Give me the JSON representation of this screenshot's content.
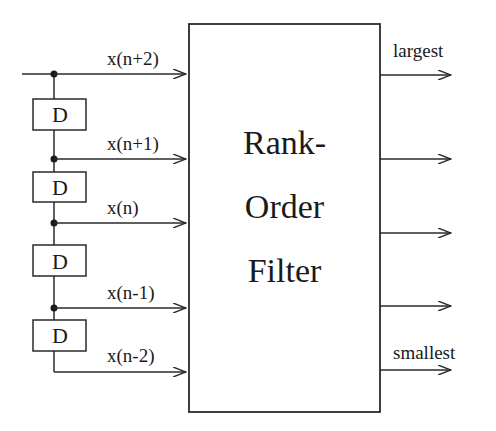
{
  "diagram": {
    "filter_block": {
      "lines": [
        "Rank-",
        "Order",
        "Filter"
      ]
    },
    "delay_blocks": [
      {
        "label": "D"
      },
      {
        "label": "D"
      },
      {
        "label": "D"
      },
      {
        "label": "D"
      }
    ],
    "inputs": [
      {
        "label": "x(n+2)"
      },
      {
        "label": "x(n+1)"
      },
      {
        "label": "x(n)"
      },
      {
        "label": "x(n-1)"
      },
      {
        "label": "x(n-2)"
      }
    ],
    "outputs": [
      {
        "label": "largest"
      },
      {
        "label": ""
      },
      {
        "label": ""
      },
      {
        "label": ""
      },
      {
        "label": "smallest"
      }
    ],
    "colors": {
      "line": "#2a2a2a",
      "background": "#ffffff"
    }
  }
}
